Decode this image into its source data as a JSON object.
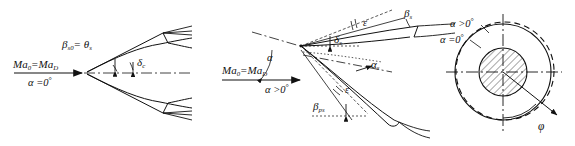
{
  "figure": {
    "panels": [
      "design-incidence-panel",
      "positive-incidence-panel",
      "circular-section-panel"
    ]
  },
  "panel_left": {
    "inflow_mach_label": "Ma",
    "inflow_mach_sub": "0",
    "inflow_mach_eq": "=Ma",
    "inflow_mach_sub2": "D",
    "alpha_label": "α =0",
    "alpha_degree": "°",
    "beta_label": "β",
    "beta_sub": "s0",
    "beta_eq": "= θ",
    "beta_theta_sub": "s",
    "delta_label": "δ",
    "delta_sub": "c"
  },
  "panel_middle": {
    "inflow_mach_label": "Ma",
    "inflow_mach_sub": "0",
    "inflow_mach_eq": "=Ma",
    "inflow_mach_sub2": "D",
    "alpha_flow_label": "α >0",
    "alpha_flow_degree": "°",
    "alpha_angle_label": "α",
    "epsilon_top_label": "ε",
    "epsilon_bottom_label": "ε",
    "beta_s_label": "β",
    "beta_s_sub": "s",
    "delta_s_label": "δ",
    "delta_s_sub": "s",
    "alpha_s_label": "α",
    "alpha_s_sub": "s",
    "beta_ps_label": "β",
    "beta_ps_sub": "ps"
  },
  "panel_right": {
    "alpha_pos_label": "α >0",
    "alpha_pos_degree": "°",
    "alpha_zero_label": "α =0",
    "alpha_zero_degree": "°",
    "phi_label": "φ"
  },
  "colors": {
    "line": "#111111",
    "background": "#ffffff",
    "hatch": "#222222"
  }
}
